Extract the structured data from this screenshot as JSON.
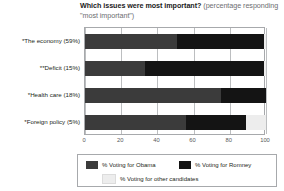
{
  "chart_data": {
    "type": "bar",
    "orientation": "horizontal",
    "stacked": true,
    "title": "Which issues were most important?",
    "subtitle": "(percentage responding \"most important\")",
    "xlabel": "",
    "ylabel": "",
    "xlim": [
      0,
      100
    ],
    "xticks": [
      0,
      20,
      40,
      60,
      80,
      100
    ],
    "grid": true,
    "legend_position": "bottom",
    "categories": [
      "*The economy (59%)",
      "**Deficit (15%)",
      "*Health care (18%)",
      "*Foreign policy (5%)"
    ],
    "series": [
      {
        "name": "% Voting for Obama",
        "color": "#3b3b3b",
        "values": [
          51,
          33,
          75,
          56
        ]
      },
      {
        "name": "% Voting for Romney",
        "color": "#141414",
        "values": [
          48,
          66,
          25,
          33
        ]
      },
      {
        "name": "% Voting for other candidates",
        "color": "#ededed",
        "values": [
          1,
          1,
          0,
          11
        ]
      }
    ]
  },
  "title": {
    "strong": "Which issues were most important? ",
    "light": "(percentage responding \"most important\")"
  },
  "legend": {
    "items": [
      {
        "label": "% Voting for Obama",
        "color": "#3b3b3b"
      },
      {
        "label": "% Voting for Romney",
        "color": "#141414"
      },
      {
        "label": "% Voting for other candidates",
        "color": "#ededed"
      }
    ]
  }
}
